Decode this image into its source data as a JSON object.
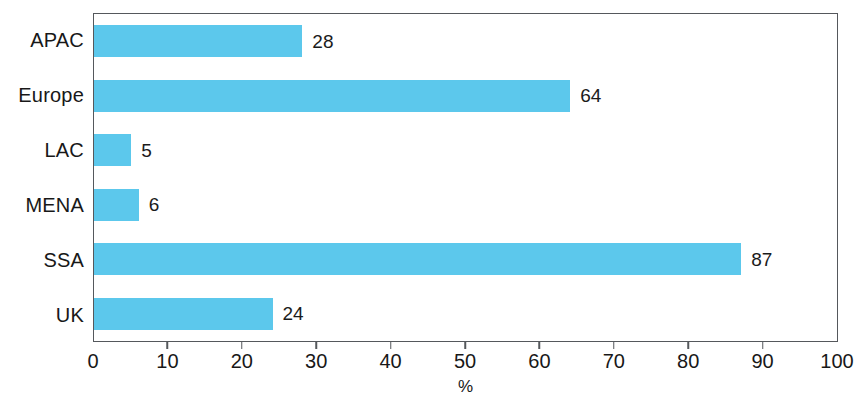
{
  "chart_data": {
    "type": "bar",
    "orientation": "horizontal",
    "title": "",
    "subtitle": "",
    "xlabel": "%",
    "ylabel": "",
    "categories": [
      "APAC",
      "Europe",
      "LAC",
      "MENA",
      "SSA",
      "UK"
    ],
    "values": [
      28,
      64,
      5,
      6,
      87,
      24
    ],
    "value_labels": [
      "28",
      "64",
      "5",
      "6",
      "87",
      "24"
    ],
    "series": [
      {
        "name": "",
        "values": [
          28,
          64,
          5,
          6,
          87,
          24
        ]
      }
    ],
    "xlim": [
      0,
      100
    ],
    "xticks": [
      0,
      10,
      20,
      30,
      40,
      50,
      60,
      70,
      80,
      90,
      100
    ],
    "xtick_labels": [
      "0",
      "10",
      "20",
      "30",
      "40",
      "50",
      "60",
      "70",
      "80",
      "90",
      "100"
    ],
    "grid": false,
    "legend": null,
    "legend_position": "none",
    "annotations": [],
    "colors": {
      "bar": "#5cc8ec",
      "axis": "#55585c",
      "text": "#181818",
      "background": "#ffffff"
    }
  }
}
